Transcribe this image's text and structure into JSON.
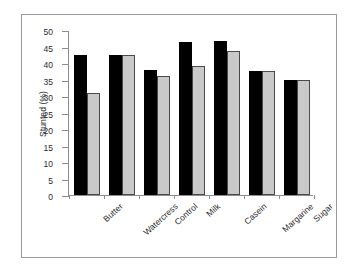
{
  "chart_data": {
    "type": "bar",
    "title": "",
    "xlabel": "",
    "ylabel": "Stunted (%)",
    "ylim": [
      0,
      50
    ],
    "yticks": [
      0,
      5,
      10,
      15,
      20,
      25,
      30,
      35,
      40,
      45,
      50
    ],
    "grid": false,
    "legend": "none",
    "categories": [
      "Butter",
      "Watercress",
      "Control",
      "Milk",
      "Casein",
      "Margarine",
      "Sugar"
    ],
    "series": [
      {
        "name": "series-1",
        "color": "#000000",
        "values": [
          42.3,
          42.3,
          37.8,
          46.4,
          46.7,
          37.6,
          35.0
        ]
      },
      {
        "name": "series-2",
        "color": "#c9c9c9",
        "values": [
          30.8,
          42.3,
          36.1,
          39.1,
          43.6,
          37.6,
          35.0
        ]
      }
    ]
  }
}
